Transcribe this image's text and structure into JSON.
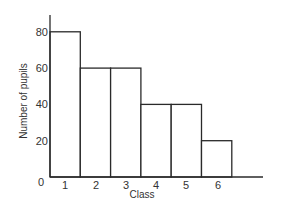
{
  "chart_data": {
    "type": "bar",
    "title": "",
    "xlabel": "Class",
    "ylabel": "Number of pupils",
    "categories": [
      "1",
      "2",
      "3",
      "4",
      "5",
      "6"
    ],
    "values": [
      80,
      60,
      60,
      40,
      40,
      20
    ],
    "ylim": [
      0,
      90
    ],
    "yticks": [
      0,
      20,
      40,
      60,
      80
    ],
    "grid": false,
    "legend": null,
    "style": "histogram, adjacent outlined bars"
  },
  "labels": {
    "xlabel": "Class",
    "ylabel": "Number of pupils",
    "origin": "0"
  },
  "colors": {
    "stroke": "#2a2a2a",
    "fill": "#ffffff",
    "text": "#333333"
  }
}
